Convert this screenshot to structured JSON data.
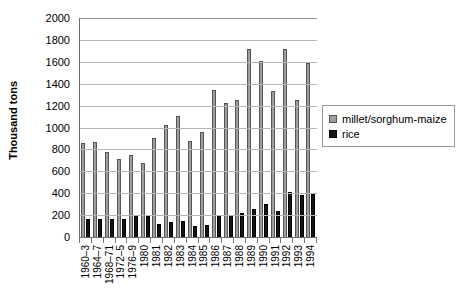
{
  "chart_data": {
    "type": "bar",
    "title": "",
    "subtitle": "",
    "xlabel": "",
    "ylabel": "Thousand tons",
    "ylim": [
      0,
      2000
    ],
    "ytick_step": 200,
    "yticks": [
      "0",
      "200",
      "400",
      "600",
      "800",
      "1000",
      "1200",
      "1400",
      "1600",
      "1800",
      "2000"
    ],
    "grid": true,
    "legend_position": "right",
    "categories": [
      "1960–3",
      "1964–7",
      "1968–71",
      "1972–5",
      "1976–9",
      "1980",
      "1981",
      "1982",
      "1983",
      "1984",
      "1985",
      "1986",
      "1987",
      "1988",
      "1989",
      "1990",
      "1991",
      "1992",
      "1993",
      "1994"
    ],
    "series": [
      {
        "name": "millet/sorghum-maize",
        "color": "#9e9e9e",
        "values": [
          855,
          870,
          780,
          715,
          745,
          680,
          900,
          1020,
          1105,
          880,
          960,
          1340,
          1225,
          1250,
          1720,
          1610,
          1330,
          1720,
          1250,
          1590
        ]
      },
      {
        "name": "rice",
        "color": "#141414",
        "values": [
          165,
          160,
          160,
          165,
          190,
          195,
          120,
          140,
          150,
          105,
          110,
          195,
          200,
          215,
          255,
          300,
          240,
          410,
          385,
          400
        ]
      }
    ]
  },
  "legend": {
    "entries": [
      {
        "label": "millet/sorghum-maize"
      },
      {
        "label": "rice"
      }
    ]
  }
}
